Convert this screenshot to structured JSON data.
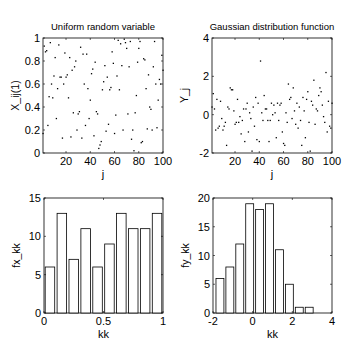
{
  "chart_data": [
    {
      "id": "uniform",
      "type": "scatter",
      "title": "Uniform random variable",
      "xlabel": "j",
      "ylabel": "X_ij(1)",
      "xlim": [
        1,
        100
      ],
      "ylim": [
        0,
        1
      ],
      "xticks": [
        20,
        40,
        60,
        80,
        100
      ],
      "xtick_labels": [
        "20",
        "40",
        "60",
        "80",
        "100"
      ],
      "yticks": [
        0,
        0.2,
        0.4,
        0.6,
        0.8,
        1
      ],
      "ytick_labels": [
        "0",
        "0.2",
        "0.4",
        "0.6",
        "0.8",
        "1"
      ],
      "grid": false,
      "frame": {
        "x": 43,
        "y": 38,
        "w": 120,
        "h": 115
      },
      "x": [
        1,
        2,
        3,
        4,
        5,
        6,
        7,
        8,
        9,
        10,
        11,
        12,
        13,
        14,
        15,
        16,
        17,
        18,
        19,
        20,
        21,
        22,
        23,
        24,
        25,
        26,
        27,
        28,
        29,
        30,
        31,
        32,
        33,
        34,
        35,
        36,
        37,
        38,
        39,
        40,
        41,
        42,
        43,
        44,
        45,
        46,
        47,
        48,
        49,
        50,
        51,
        52,
        53,
        54,
        55,
        56,
        57,
        58,
        59,
        60,
        61,
        62,
        63,
        64,
        65,
        66,
        67,
        68,
        69,
        70,
        71,
        72,
        73,
        74,
        75,
        76,
        77,
        78,
        79,
        80,
        81,
        82,
        83,
        84,
        85,
        86,
        87,
        88,
        89,
        90,
        91,
        92,
        93,
        94,
        95,
        96,
        97,
        98,
        99,
        100
      ],
      "y": [
        0.17,
        0.93,
        0.88,
        0.89,
        0.24,
        0.49,
        0.96,
        0.6,
        0.48,
        0.67,
        0.83,
        0.3,
        0.56,
        0.94,
        0.66,
        0.66,
        0.13,
        0.6,
        0.87,
        0.66,
        0.68,
        0.48,
        0.83,
        0.14,
        0.72,
        0.35,
        0.75,
        0.8,
        0.2,
        0.34,
        0.36,
        0.92,
        0.13,
        0.86,
        0.6,
        0.24,
        0.86,
        0.56,
        0.3,
        0.46,
        0.69,
        0.73,
        0.15,
        0.79,
        0.36,
        0.34,
        0.04,
        0.07,
        0.1,
        0.55,
        0.62,
        0.76,
        0.19,
        0.66,
        0.25,
        0.55,
        0.57,
        0.88,
        0.78,
        0.17,
        0.33,
        0.67,
        0.98,
        0.55,
        0.95,
        0.76,
        0.2,
        0.99,
        0.96,
        0.91,
        0.34,
        0.75,
        0.97,
        0.12,
        0.2,
        0.02,
        0.35,
        0.5,
        0.79,
        0.91,
        0.97,
        0.09,
        0.1,
        0.82,
        0.81,
        0.56,
        0.21,
        0.68,
        0.4,
        0.38,
        0.2,
        0.75,
        0.97,
        0.6,
        0.22,
        0.46,
        0.64,
        0.6,
        0.85,
        0.72
      ]
    },
    {
      "id": "gaussian",
      "type": "scatter",
      "title": "Gaussian distribution function",
      "xlabel": "j",
      "ylabel": "Y_j",
      "xlim": [
        1,
        100
      ],
      "ylim": [
        -2,
        4
      ],
      "xticks": [
        20,
        40,
        60,
        80,
        100
      ],
      "xtick_labels": [
        "20",
        "40",
        "60",
        "80",
        "100"
      ],
      "yticks": [
        -2,
        0,
        2,
        4
      ],
      "ytick_labels": [
        "-2",
        "0",
        "2",
        "4"
      ],
      "grid": false,
      "frame": {
        "x": 212,
        "y": 38,
        "w": 120,
        "h": 115
      },
      "x": [
        1,
        2,
        3,
        4,
        5,
        6,
        7,
        8,
        9,
        10,
        11,
        12,
        13,
        14,
        15,
        16,
        17,
        18,
        19,
        20,
        21,
        22,
        23,
        24,
        25,
        26,
        27,
        28,
        29,
        30,
        31,
        32,
        33,
        34,
        35,
        36,
        37,
        38,
        39,
        40,
        41,
        42,
        43,
        44,
        45,
        46,
        47,
        48,
        49,
        50,
        51,
        52,
        53,
        54,
        55,
        56,
        57,
        58,
        59,
        60,
        61,
        62,
        63,
        64,
        65,
        66,
        67,
        68,
        69,
        70,
        71,
        72,
        73,
        74,
        75,
        76,
        77,
        78,
        79,
        80,
        81,
        82,
        83,
        84,
        85,
        86,
        87,
        88,
        89,
        90,
        91,
        92,
        93,
        94,
        95,
        96,
        97,
        98,
        99,
        100
      ],
      "y": [
        0.4,
        1.1,
        0.3,
        -0.8,
        0.8,
        -0.7,
        -0.6,
        0.7,
        -0.2,
        -0.8,
        -0.6,
        -0.4,
        -1.6,
        0.4,
        0.3,
        1.4,
        1.3,
        1.3,
        0.2,
        -0.5,
        -0.4,
        0.8,
        -0.4,
        -0.1,
        -1.0,
        -0.3,
        0.3,
        -1.4,
        0.3,
        0.6,
        -0.9,
        0.1,
        -0.2,
        -1.9,
        0.4,
        -0.6,
        0.9,
        -1.3,
        0.6,
        -1.4,
        2.8,
        0.1,
        -0.3,
        1.0,
        0.3,
        0.3,
        -0.3,
        -1.4,
        -0.3,
        0.6,
        0.0,
        0.5,
        0.1,
        -1.2,
        0.6,
        -0.3,
        0.5,
        0.6,
        -0.9,
        -1.5,
        -1.6,
        0.1,
        -0.4,
        1.6,
        0.8,
        0.9,
        -0.2,
        1.4,
        0.2,
        -0.5,
        0.6,
        -0.7,
        0.4,
        -0.3,
        -1.6,
        0.9,
        0.2,
        -1.2,
        0.8,
        1.2,
        -0.4,
        -1.9,
        0.7,
        0.5,
        1.8,
        -0.5,
        0.3,
        0.2,
        1.0,
        1.4,
        1.2,
        0.5,
        -0.1,
        -0.4,
        2.2,
        -0.9,
        0.7,
        -0.6,
        -0.7,
        0.6
      ]
    },
    {
      "id": "hist-uniform",
      "type": "bar",
      "title": "",
      "xlabel": "kk",
      "ylabel": "fx_kk",
      "xlim": [
        0,
        1
      ],
      "ylim": [
        0,
        15
      ],
      "xticks": [
        0,
        0.5,
        1
      ],
      "xtick_labels": [
        "0",
        "0.5",
        "1"
      ],
      "yticks": [
        0,
        5,
        10,
        15
      ],
      "ytick_labels": [
        "0",
        "5",
        "10",
        "15"
      ],
      "grid": false,
      "frame": {
        "x": 44,
        "y": 198,
        "w": 119,
        "h": 115
      },
      "bin_centers": [
        0.05,
        0.15,
        0.25,
        0.35,
        0.45,
        0.55,
        0.65,
        0.75,
        0.85,
        0.95
      ],
      "bin_width": 0.1,
      "values": [
        6,
        13,
        7,
        11,
        6,
        9,
        13,
        11,
        11,
        13
      ]
    },
    {
      "id": "hist-gaussian",
      "type": "bar",
      "title": "",
      "xlabel": "kk",
      "ylabel": "fy_kk",
      "xlim": [
        -2,
        4
      ],
      "ylim": [
        0,
        20
      ],
      "xticks": [
        -2,
        0,
        2,
        4
      ],
      "xtick_labels": [
        "-2",
        "0",
        "2",
        "4"
      ],
      "yticks": [
        0,
        5,
        10,
        15,
        20
      ],
      "ytick_labels": [
        "0",
        "5",
        "10",
        "15",
        "20"
      ],
      "grid": false,
      "frame": {
        "x": 213,
        "y": 198,
        "w": 119,
        "h": 115
      },
      "bin_centers": [
        -1.65,
        -1.15,
        -0.65,
        -0.15,
        0.35,
        0.85,
        1.35,
        1.85,
        2.35,
        2.85
      ],
      "bin_width": 0.5,
      "values": [
        6,
        8,
        12,
        19,
        18,
        19,
        11,
        5,
        1,
        1
      ]
    }
  ]
}
